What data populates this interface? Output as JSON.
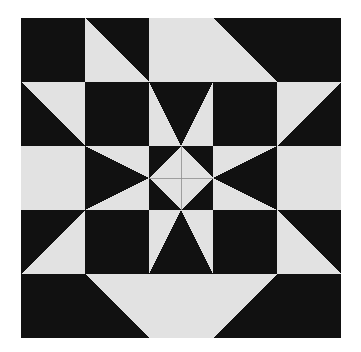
{
  "artwork": {
    "title": "Patchwork Quilt Block",
    "kind": "quilt-block",
    "grid_rows": 5,
    "grid_cols": 5,
    "block_left_px": 21,
    "block_top_px": 18,
    "block_size_px": 320,
    "cell_size_px": 64,
    "canvas_width_px": 361,
    "canvas_height_px": 352
  },
  "colors": {
    "background": "#ffffff",
    "dark": "#111111",
    "light": "#e2e2e2",
    "seam_line": "#8a8a8a"
  },
  "legend": [
    {
      "name": "dark-patch",
      "swatch": "#111111",
      "label": "Dark fabric"
    },
    {
      "name": "light-patch",
      "swatch": "#e2e2e2",
      "label": "Light fabric"
    }
  ],
  "chart_data": {
    "type": "heatmap",
    "xlabel": "",
    "ylabel": "",
    "categories": [
      "col-1",
      "col-2",
      "col-3",
      "col-4",
      "col-5"
    ],
    "row_categories": [
      "row-1",
      "row-2",
      "row-3",
      "row-4",
      "row-5"
    ],
    "palette": {
      "dark": "#111111",
      "light": "#e2e2e2"
    },
    "cells": [
      {
        "row": 1,
        "col": 1,
        "name": "corner-dark-square",
        "unit": "solid",
        "fill": "dark"
      },
      {
        "row": 1,
        "col": 2,
        "name": "hst-light-lower-left",
        "unit": "half-square-triangle",
        "dark_corner": "top-right",
        "fill": "dark-light"
      },
      {
        "row": 1,
        "col": 3,
        "name": "top-light-square",
        "unit": "solid",
        "fill": "light"
      },
      {
        "row": 1,
        "col": 4,
        "name": "hst-light-lower-left",
        "unit": "half-square-triangle",
        "dark_corner": "top-right",
        "fill": "dark-light"
      },
      {
        "row": 1,
        "col": 5,
        "name": "corner-dark-square",
        "unit": "solid",
        "fill": "dark"
      },
      {
        "row": 2,
        "col": 1,
        "name": "hst-light-upper-right",
        "unit": "half-square-triangle",
        "dark_corner": "bottom-left",
        "fill": "dark-light"
      },
      {
        "row": 2,
        "col": 2,
        "name": "dark-square",
        "unit": "solid",
        "fill": "dark"
      },
      {
        "row": 2,
        "col": 3,
        "name": "half-hourglass-point-down",
        "unit": "quarter-square-triangle",
        "point": "down",
        "fill": "light-dark"
      },
      {
        "row": 2,
        "col": 4,
        "name": "dark-square",
        "unit": "solid",
        "fill": "dark"
      },
      {
        "row": 2,
        "col": 5,
        "name": "hst-light-upper-left",
        "unit": "half-square-triangle",
        "dark_corner": "bottom-right",
        "fill": "dark-light"
      },
      {
        "row": 3,
        "col": 1,
        "name": "side-light-square",
        "unit": "solid",
        "fill": "light"
      },
      {
        "row": 3,
        "col": 2,
        "name": "hst-dark-point-right",
        "unit": "quarter-square-triangle",
        "point": "right",
        "fill": "light-dark"
      },
      {
        "row": 3,
        "col": 3,
        "name": "center-diamond-four-patch",
        "unit": "four-patch-diamond",
        "fill": "light-dark"
      },
      {
        "row": 3,
        "col": 4,
        "name": "hst-dark-point-left",
        "unit": "quarter-square-triangle",
        "point": "left",
        "fill": "light-dark"
      },
      {
        "row": 3,
        "col": 5,
        "name": "side-light-square",
        "unit": "solid",
        "fill": "light"
      },
      {
        "row": 4,
        "col": 1,
        "name": "hst-light-lower-right",
        "unit": "half-square-triangle",
        "dark_corner": "top-left",
        "fill": "dark-light"
      },
      {
        "row": 4,
        "col": 2,
        "name": "dark-square",
        "unit": "solid",
        "fill": "dark"
      },
      {
        "row": 4,
        "col": 3,
        "name": "half-hourglass-point-up",
        "unit": "quarter-square-triangle",
        "point": "up",
        "fill": "light-dark"
      },
      {
        "row": 4,
        "col": 4,
        "name": "dark-square",
        "unit": "solid",
        "fill": "dark"
      },
      {
        "row": 4,
        "col": 5,
        "name": "hst-light-lower-left",
        "unit": "half-square-triangle",
        "dark_corner": "top-right",
        "fill": "dark-light"
      },
      {
        "row": 5,
        "col": 1,
        "name": "corner-dark-square",
        "unit": "solid",
        "fill": "dark"
      },
      {
        "row": 5,
        "col": 2,
        "name": "hst-light-upper-right",
        "unit": "half-square-triangle",
        "dark_corner": "bottom-left",
        "fill": "dark-light"
      },
      {
        "row": 5,
        "col": 3,
        "name": "bottom-light-square",
        "unit": "solid",
        "fill": "light"
      },
      {
        "row": 5,
        "col": 4,
        "name": "hst-light-upper-left",
        "unit": "half-square-triangle",
        "dark_corner": "bottom-right",
        "fill": "dark-light"
      },
      {
        "row": 5,
        "col": 5,
        "name": "corner-dark-square",
        "unit": "solid",
        "fill": "dark"
      }
    ]
  }
}
